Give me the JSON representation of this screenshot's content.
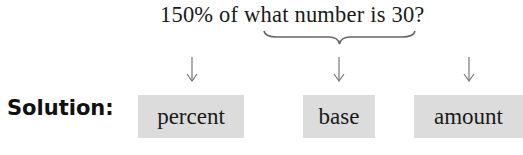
{
  "question": {
    "part1": "150% of ",
    "part2": "what number",
    "part3": " is 30?"
  },
  "solution_label": "Solution:",
  "boxes": [
    {
      "label": "percent"
    },
    {
      "label": "base"
    },
    {
      "label": "amount"
    }
  ],
  "colors": {
    "box_fill": "#dcdcdc",
    "text": "#1a1a1a",
    "arrow": "#777777"
  }
}
